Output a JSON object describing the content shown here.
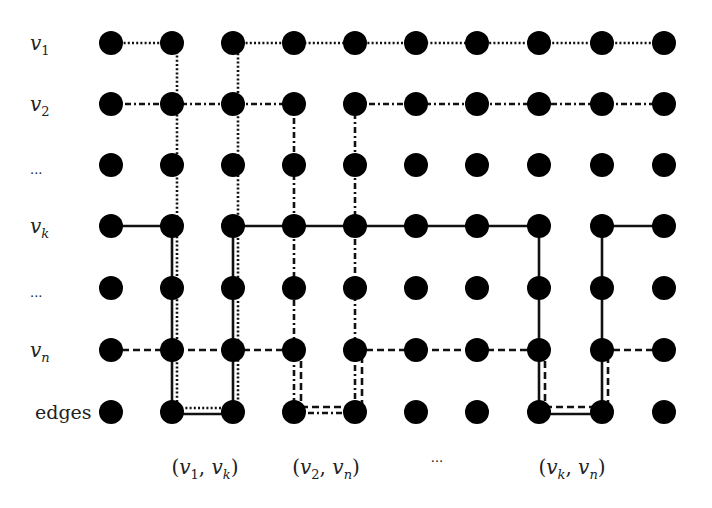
{
  "diagram": {
    "type": "grid-graph-paths",
    "node_color": "#000000",
    "node_radius": 12,
    "columns_x": [
      111,
      172,
      233,
      294,
      355,
      416,
      477,
      539,
      602,
      664
    ],
    "rows": [
      {
        "id": "v1",
        "label_main": "v",
        "label_sub": "1",
        "y": 43
      },
      {
        "id": "v2",
        "label_main": "v",
        "label_sub": "2",
        "y": 104
      },
      {
        "id": "dots1",
        "label_main": "...",
        "label_sub": "",
        "y": 165
      },
      {
        "id": "vk",
        "label_main": "v",
        "label_sub": "k",
        "y": 226
      },
      {
        "id": "dots2",
        "label_main": "...",
        "label_sub": "",
        "y": 288
      },
      {
        "id": "vn",
        "label_main": "v",
        "label_sub": "n",
        "y": 350
      },
      {
        "id": "edges",
        "label_main": "edges",
        "label_sub": "",
        "y": 412
      }
    ],
    "paths": [
      {
        "name": "v1-path",
        "style": "dotted",
        "row": "v1",
        "edge": "(v1,vk)"
      },
      {
        "name": "v2-path",
        "style": "dash-dot",
        "row": "v2",
        "edge": "(v2,vn)"
      },
      {
        "name": "vk-path",
        "style": "solid",
        "row": "vk",
        "edge": "(v1,vk),(vk,vn)"
      },
      {
        "name": "vn-path",
        "style": "dashed",
        "row": "vn",
        "edge": "(v2,vn),(vk,vn)"
      }
    ],
    "column_labels": [
      {
        "text_a": "(",
        "v1": "v",
        "s1": "1",
        "sep": ", ",
        "v2": "v",
        "s2": "k",
        "text_b": ")",
        "x": 205
      },
      {
        "text_a": "(",
        "v1": "v",
        "s1": "2",
        "sep": ", ",
        "v2": "v",
        "s2": "n",
        "text_b": ")",
        "x": 326
      },
      {
        "ellipsis": "...",
        "x": 437
      },
      {
        "text_a": "(",
        "v1": "v",
        "s1": "k",
        "sep": ", ",
        "v2": "v",
        "s2": "n",
        "text_b": ")",
        "x": 572
      }
    ]
  }
}
